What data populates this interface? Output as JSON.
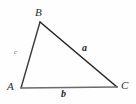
{
  "figure": {
    "type": "geometry-diagram",
    "shape": "triangle",
    "background_color": "#fefefe",
    "vertices": [
      {
        "name": "A",
        "label": "A",
        "x": 21,
        "y": 88
      },
      {
        "name": "B",
        "label": "B",
        "x": 40,
        "y": 22
      },
      {
        "name": "C",
        "label": "C",
        "x": 117,
        "y": 87
      }
    ],
    "sides": [
      {
        "name": "a",
        "label": "a",
        "from": "B",
        "to": "C",
        "color": "#262626",
        "width": 1.6
      },
      {
        "name": "b",
        "label": "b",
        "from": "A",
        "to": "C",
        "color": "#6b6b6b",
        "width": 1.4
      },
      {
        "name": "c",
        "label": "c",
        "from": "A",
        "to": "B",
        "color": "#3a3a3a",
        "width": 1.4
      }
    ],
    "labels": {
      "vertex_a": "A",
      "vertex_b": "B",
      "vertex_c": "C",
      "side_a": "a",
      "side_b": "b",
      "side_c": "c"
    },
    "colors": {
      "stroke_dark": "#262626",
      "stroke_mid": "#3a3a3a",
      "stroke_light": "#6b6b6b",
      "vertex_text": "#2b2b2b",
      "side_text": "#1f1f1f",
      "side_text_faint": "#6a6a6a"
    }
  }
}
